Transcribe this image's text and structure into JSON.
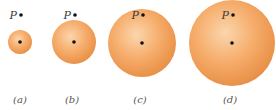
{
  "figure": {
    "colors": {
      "sphere_light": "#fbd6ad",
      "sphere_mid": "#f6ad6c",
      "sphere_edge": "#e99148",
      "dot": "#111111",
      "text": "#3a3a3a"
    },
    "panels": [
      {
        "id": "a",
        "caption": "(a)",
        "point_label": "P",
        "cx": 20,
        "cy": 42,
        "r": 12,
        "px": 21,
        "py": 15,
        "cap_x": 20
      },
      {
        "id": "b",
        "caption": "(b)",
        "point_label": "P",
        "cx": 74,
        "cy": 42,
        "r": 22,
        "px": 75,
        "py": 15,
        "cap_x": 72
      },
      {
        "id": "c",
        "caption": "(c)",
        "point_label": "P",
        "cx": 142,
        "cy": 43,
        "r": 34,
        "px": 143,
        "py": 15,
        "cap_x": 140
      },
      {
        "id": "d",
        "caption": "(d)",
        "point_label": "P",
        "cx": 232,
        "cy": 43,
        "r": 43,
        "px": 233,
        "py": 15,
        "cap_x": 230
      }
    ]
  }
}
